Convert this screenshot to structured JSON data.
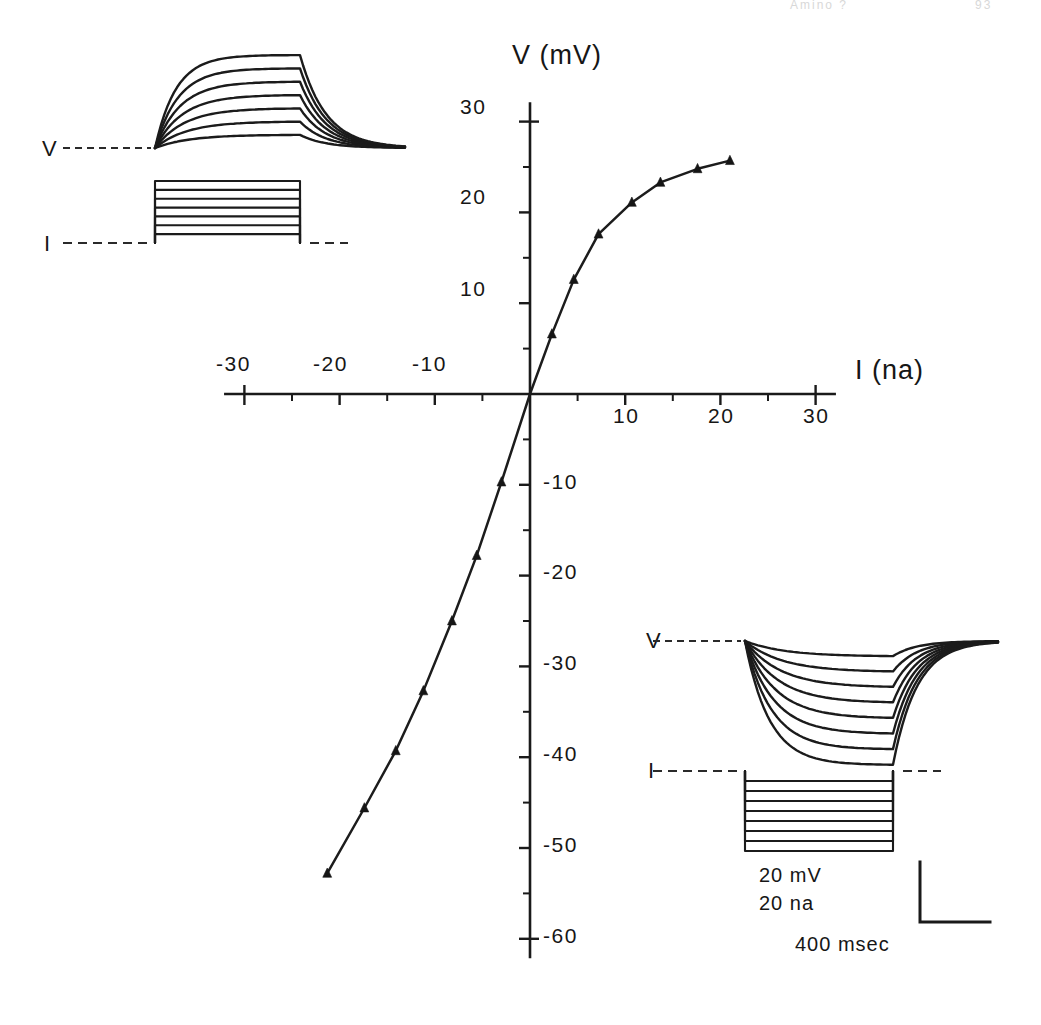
{
  "header": {
    "running_head": "Amino ?",
    "page_number": "93"
  },
  "axes": {
    "y_title": "V (mV)",
    "x_title": "I (na)",
    "x_ticklabels_negative": [
      "-30",
      "-20",
      "-10"
    ],
    "x_ticklabels_positive": [
      "10",
      "20",
      "30"
    ],
    "y_ticklabels_positive": [
      "30",
      "20",
      "10"
    ],
    "y_ticklabels_negative": [
      "-10",
      "-20",
      "-30",
      "-40",
      "-50",
      "-60"
    ],
    "x_range": [
      -32,
      32
    ],
    "y_range": [
      -62,
      32
    ],
    "x_major_step": 10,
    "x_minor_step": 5,
    "y_major_step": 10,
    "y_minor_step": 5
  },
  "insets": {
    "top_left": {
      "voltage_label": "V",
      "current_label": "I",
      "description": "depolarizing responses",
      "n_traces": 7
    },
    "bottom_right": {
      "voltage_label": "V",
      "current_label": "I",
      "description": "hyperpolarizing responses",
      "n_traces": 8
    }
  },
  "scalebar": {
    "voltage": "20 mV",
    "current": "20 na",
    "time": "400 msec"
  },
  "chart_data": {
    "type": "scatter",
    "title": "",
    "xlabel": "I (na)",
    "ylabel": "V (mV)",
    "xlim": [
      -32,
      32
    ],
    "ylim": [
      -62,
      32
    ],
    "grid": false,
    "legend": null,
    "marker": "triangle",
    "connected": true,
    "series": [
      {
        "name": "current-voltage relation",
        "points": [
          [
            -21.3,
            -52.8
          ],
          [
            -17.4,
            -45.6
          ],
          [
            -14.1,
            -39.3
          ],
          [
            -11.2,
            -32.7
          ],
          [
            -8.2,
            -25.0
          ],
          [
            -5.6,
            -17.8
          ],
          [
            -3.0,
            -9.7
          ],
          [
            0.0,
            0.0
          ],
          [
            2.3,
            6.6
          ],
          [
            4.6,
            12.6
          ],
          [
            7.2,
            17.6
          ],
          [
            10.7,
            21.1
          ],
          [
            13.7,
            23.3
          ],
          [
            17.6,
            24.8
          ],
          [
            21.0,
            25.7
          ]
        ]
      }
    ]
  }
}
